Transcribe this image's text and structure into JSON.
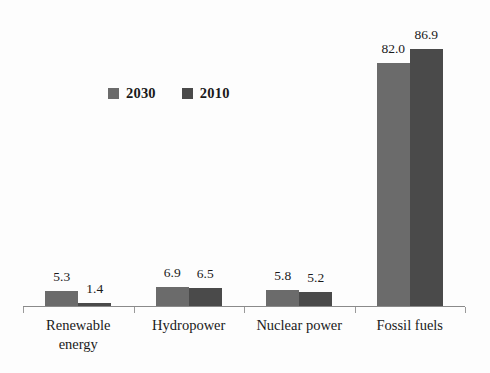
{
  "chart_data": {
    "type": "bar",
    "title": "",
    "subtitle": "",
    "xlabel": "",
    "ylabel": "",
    "grid": false,
    "legend_position": "top-left-inside",
    "axis": {
      "y_visible": false,
      "x_visible": true,
      "ylim": [
        0,
        100
      ]
    },
    "categories": [
      "Renewable energy",
      "Hydropower",
      "Nuclear power",
      "Fossil fuels"
    ],
    "category_lines": [
      [
        "Renewable",
        "energy"
      ],
      [
        "Hydropower",
        ""
      ],
      [
        "Nuclear power",
        ""
      ],
      [
        "Fossil fuels",
        ""
      ]
    ],
    "series": [
      {
        "name": "2030",
        "color": "#6b6b6b",
        "values": [
          5.3,
          6.9,
          5.8,
          82.0
        ],
        "labels": [
          "5.3",
          "6.9",
          "5.8",
          "82.0"
        ]
      },
      {
        "name": "2010",
        "color": "#4a4a4a",
        "values": [
          1.4,
          6.5,
          5.2,
          86.9
        ],
        "labels": [
          "1.4",
          "6.5",
          "5.2",
          "86.9"
        ]
      }
    ]
  },
  "legend": {
    "items": [
      {
        "label": "2030",
        "color": "#6b6b6b"
      },
      {
        "label": "2010",
        "color": "#4a4a4a"
      }
    ]
  }
}
